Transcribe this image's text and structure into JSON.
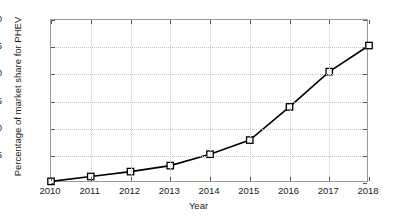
{
  "chart_data": {
    "type": "line",
    "title": "",
    "xlabel": "Year",
    "ylabel": "Percentage of market share for PHEV",
    "x": [
      2010,
      2011,
      2012,
      2013,
      2014,
      2015,
      2016,
      2017,
      2018
    ],
    "values": [
      0.3,
      1.2,
      2.1,
      3.2,
      5.3,
      7.9,
      14.0,
      20.5,
      25.3
    ],
    "xlim": [
      2010,
      2018
    ],
    "ylim": [
      0,
      30
    ],
    "xticks": [
      2010,
      2011,
      2012,
      2013,
      2014,
      2015,
      2016,
      2017,
      2018
    ],
    "xticklabels": [
      "2010",
      "2011",
      "2012",
      "2013",
      "2014",
      "2015",
      "2016",
      "2017",
      "2018"
    ],
    "yticks": [
      0,
      5,
      10,
      15,
      20,
      25,
      30
    ],
    "yticklabels": [
      "",
      "5",
      "10",
      "15",
      "20",
      "25",
      "30"
    ],
    "grid": true,
    "legend": null,
    "legend_position": "none",
    "line_color": "#000000",
    "marker": "square",
    "marker_facecolor": "#ffffff",
    "marker_edgecolor": "#000000",
    "grid_color": "#c8c8c8",
    "axis_color": "#9a9a9a",
    "background_color": "#ffffff"
  }
}
